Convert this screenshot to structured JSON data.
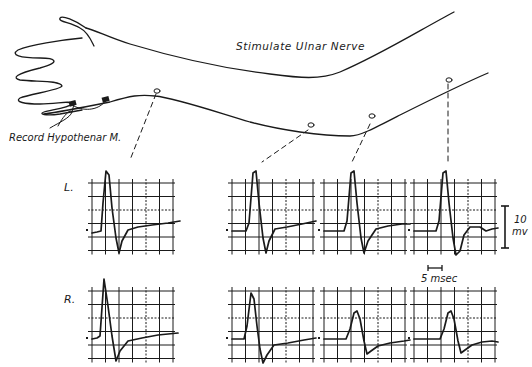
{
  "labels": {
    "stimulate": "Stimulate Ulnar Nerve",
    "record": "Record Hypothenar M.",
    "row_left": "L.",
    "row_right": "R.",
    "scale_voltage_value": "10",
    "scale_voltage_unit": "mv",
    "scale_time": "5 msec"
  },
  "colors": {
    "ink": "#1a1a1a",
    "background": "#ffffff"
  },
  "grid": {
    "cols": 6,
    "rows": 6,
    "cell": 13.5
  },
  "panels": {
    "left": [
      {
        "x": 92,
        "y": 183,
        "trace": "M0,50 L5,49 L9,48 L11,20 L14,-12 L17,-8 L20,25 L24,55 L27,70 L30,58 L36,47 L46,44 L60,42 L76,40 L88,38"
      },
      {
        "x": 232,
        "y": 183,
        "trace": "M0,48 L14,48 L17,40 L21,-10 L24,-12 L27,20 L31,55 L34,70 L37,58 L43,46 L55,44 L70,41 L84,38"
      },
      {
        "x": 324,
        "y": 183,
        "trace": "M0,48 L20,48 L23,38 L27,-10 L30,-12 L33,20 L37,55 L40,70 L44,58 L52,46 L64,43 L78,41 L86,41"
      },
      {
        "x": 414,
        "y": 183,
        "trace": "M0,48 L22,48 L25,38 L29,-10 L32,-12 L35,20 L39,55 L42,72 L46,68 L50,52 L56,44 L66,44 L72,48 L78,46 L84,45"
      }
    ],
    "right": [
      {
        "x": 92,
        "y": 291,
        "trace": "M0,48 L5,47 L8,45 L12,-12 L16,15 L20,45 L24,70 L28,60 L36,50 L50,47 L66,44 L86,42"
      },
      {
        "x": 232,
        "y": 291,
        "trace": "M0,48 L12,48 L15,35 L19,2 L22,8 L25,35 L28,58 L31,72 L35,64 L42,54 L56,52 L72,49 L84,47"
      },
      {
        "x": 324,
        "y": 291,
        "trace": "M0,48 L22,48 L26,38 L30,22 L33,20 L36,28 L40,50 L43,63 L47,60 L54,55 L66,52 L80,50 L86,49"
      },
      {
        "x": 414,
        "y": 291,
        "trace": "M0,48 L26,48 L30,38 L34,22 L37,20 L40,28 L44,50 L47,62 L51,59 L58,54 L68,51 L78,50 L84,51"
      }
    ]
  }
}
